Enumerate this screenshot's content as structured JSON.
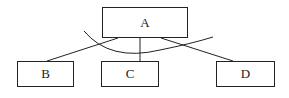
{
  "diagram": {
    "type": "tree",
    "nodes": [
      {
        "id": "A",
        "label": "A",
        "x": 102,
        "y": 7,
        "w": 86,
        "h": 31
      },
      {
        "id": "B",
        "label": "B",
        "x": 17,
        "y": 61,
        "w": 57,
        "h": 26
      },
      {
        "id": "C",
        "label": "C",
        "x": 101,
        "y": 61,
        "w": 58,
        "h": 26
      },
      {
        "id": "D",
        "label": "D",
        "x": 216,
        "y": 61,
        "w": 59,
        "h": 26
      }
    ],
    "edges": [
      {
        "from": "A",
        "to": "B"
      },
      {
        "from": "A",
        "to": "C"
      },
      {
        "from": "A",
        "to": "D"
      }
    ],
    "annotation": "curved arc crossing all three edges below A"
  },
  "colors": {
    "stroke": "#222222",
    "background": "#ffffff"
  }
}
